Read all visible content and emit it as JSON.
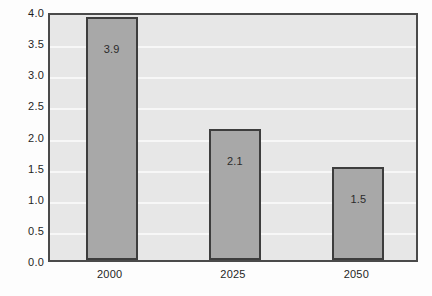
{
  "chart_data": {
    "type": "bar",
    "title": "",
    "subtitle": "",
    "xlabel": "",
    "ylabel": "",
    "categories": [
      "2000",
      "2025",
      "2050"
    ],
    "values": [
      3.9,
      2.1,
      1.5
    ],
    "data_labels": [
      "3.9",
      "2.1",
      "1.5"
    ],
    "ylim": [
      0.0,
      4.0
    ],
    "ytick_step": 0.5,
    "yticks": [
      "4.0",
      "3.5",
      "3.0",
      "2.5",
      "2.0",
      "1.5",
      "1.0",
      "0.5",
      "0.0"
    ],
    "ytick_values": [
      4.0,
      3.5,
      3.0,
      2.5,
      2.0,
      1.5,
      1.0,
      0.5,
      0.0
    ],
    "grid": true,
    "grid_axis": "y",
    "legend": false,
    "legend_position": "none",
    "colors": {
      "bar_fill": "#a8a8a8",
      "bar_edge": "#3d3d3d",
      "plot_background": "#e7e7e7",
      "gridline": "#f7f7f7",
      "frame": "#4a4a4a",
      "text": "#1f1f1f",
      "figure_background": "#fdfdfd"
    }
  }
}
